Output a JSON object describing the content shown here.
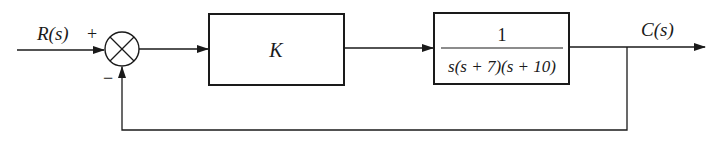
{
  "diagram": {
    "type": "feedback-control-block-diagram",
    "input": {
      "label": "R(s)"
    },
    "output": {
      "label": "C(s)"
    },
    "summing_junction": {
      "signs": {
        "top": "+",
        "bottom": "−"
      }
    },
    "blocks": [
      {
        "id": "controller",
        "label": "K"
      },
      {
        "id": "plant",
        "numerator": "1",
        "denominator": "s(s + 7)(s + 10)"
      }
    ],
    "feedback": {
      "type": "unity",
      "sign": "negative"
    },
    "colors": {
      "stroke": "#1a1a1a",
      "background": "#ffffff"
    }
  }
}
